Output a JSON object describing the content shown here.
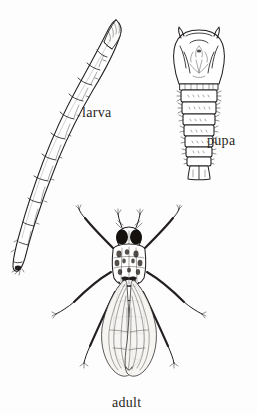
{
  "plate": {
    "kind": "scientific-illustration",
    "subject": "insect life cycle stages",
    "width": 257,
    "height": 415,
    "background_color": "#fdfdfd",
    "ink_color": "#231f20",
    "style": "black-and-white stippled line engraving"
  },
  "labels": {
    "larva": "larva",
    "pupa": "pupa",
    "adult": "adult"
  },
  "figures": [
    {
      "id": "larva",
      "label": "larva",
      "description": "elongate curved segmented legless larva, head at upper right, tapering tail at lower left",
      "segments": 11,
      "position": {
        "x": 10,
        "y": 15,
        "width": 110,
        "height": 260
      }
    },
    {
      "id": "pupa",
      "label": "pupa",
      "description": "pupa with broad rounded head-thorax capsule and seven spined abdominal segments ending in a forked tail",
      "abdominal_segments": 7,
      "position": {
        "x": 168,
        "y": 25,
        "width": 62,
        "height": 155
      }
    },
    {
      "id": "adult",
      "label": "adult",
      "description": "dorsal view of adult fly with large compound eyes, mottled thorax, folded overlapping wings and six outspread legs",
      "legs": 6,
      "wings": 2,
      "position": {
        "x": 62,
        "y": 200,
        "width": 135,
        "height": 185
      }
    }
  ]
}
